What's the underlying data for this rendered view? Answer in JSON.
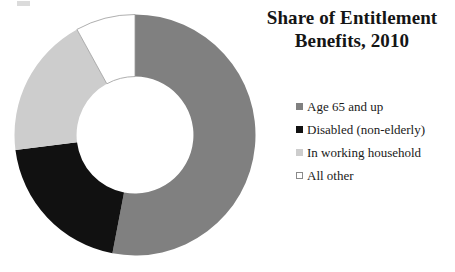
{
  "chart_data": {
    "type": "pie",
    "variant": "donut",
    "title": "Share of Entitlement Benefits, 2010",
    "title_lines": [
      "Share of Entitlement",
      "Benefits, 2010"
    ],
    "categories": [
      "Age 65 and up",
      "Disabled (non-elderly)",
      "In working household",
      "All other"
    ],
    "values": [
      53,
      20,
      19,
      8
    ],
    "units": "percent",
    "colors": [
      "#808080",
      "#111111",
      "#cdcdcd",
      "#ffffff"
    ],
    "start_angle_deg": 0,
    "direction": "clockwise",
    "inner_radius_ratio": 0.485,
    "legend_position": "right",
    "data_labels": false,
    "grid": false,
    "xlabel": "",
    "ylabel": "",
    "slices": [
      {
        "label": "Age 65 and up",
        "value": 53,
        "color": "#808080",
        "start_deg": 0,
        "end_deg": 190.8,
        "swatch": "filled"
      },
      {
        "label": "Disabled (non-elderly)",
        "value": 20,
        "color": "#111111",
        "start_deg": 190.8,
        "end_deg": 262.8,
        "swatch": "filled"
      },
      {
        "label": "In working household",
        "value": 19,
        "color": "#cdcdcd",
        "start_deg": 262.8,
        "end_deg": 331.2,
        "swatch": "filled"
      },
      {
        "label": "All other",
        "value": 8,
        "color": "#ffffff",
        "start_deg": 331.2,
        "end_deg": 360,
        "swatch": "outlined"
      }
    ]
  },
  "legend": {
    "items": [
      {
        "label": "Age 65 and up"
      },
      {
        "label": "Disabled (non-elderly)"
      },
      {
        "label": "In working household"
      },
      {
        "label": "All other"
      }
    ]
  }
}
